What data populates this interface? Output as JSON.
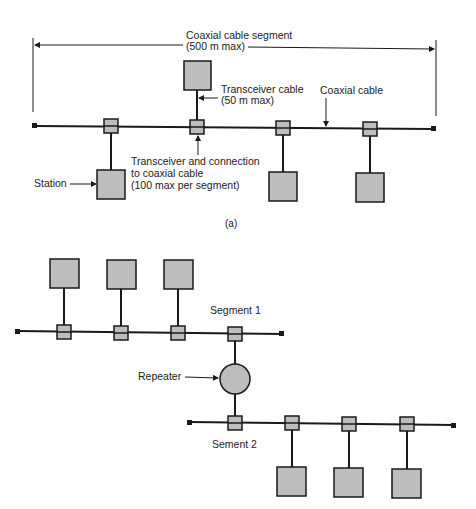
{
  "colors": {
    "line": "#1a1a1a",
    "box_fill": "#bdbdbd",
    "box_stroke": "#1a1a1a",
    "background": "#ffffff"
  },
  "diagram_a": {
    "caption": "(a)",
    "segment_label_line1": "Coaxial cable segment",
    "segment_label_line2": "(500 m max)",
    "transceiver_cable_line1": "Transceiver cable",
    "transceiver_cable_line2": "(50 m max)",
    "coaxial_cable_label": "Coaxial cable",
    "transceiver_label_line1": "Transceiver and connection",
    "transceiver_label_line2": "to coaxial cable",
    "transceiver_label_line3": "(100 max per segment)",
    "station_label": "Station"
  },
  "diagram_b": {
    "segment1_label": "Segment 1",
    "segment2_label": "Sement 2",
    "repeater_label": "Repeater"
  }
}
